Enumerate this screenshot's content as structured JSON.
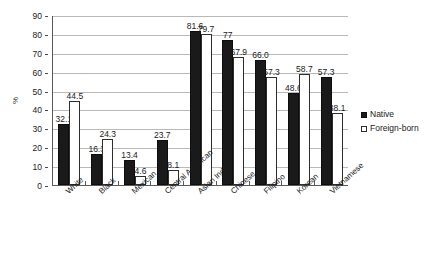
{
  "chart_data": {
    "type": "bar",
    "title": "",
    "subtitle": "",
    "xlabel": "",
    "ylabel": "%",
    "ylim": [
      0,
      90
    ],
    "ytick_step": 10,
    "yticks": [
      "0",
      "10",
      "20",
      "30",
      "40",
      "50",
      "60",
      "70",
      "80",
      "90"
    ],
    "grid": true,
    "grid_axis": "y",
    "legend_position": "right",
    "categories": [
      "White",
      "Black",
      "Mexican",
      "Central American",
      "Asian Indian",
      "Chinese",
      "Filipino",
      "Korean",
      "Vietnamese"
    ],
    "series": [
      {
        "name": "Native",
        "color": "#1a1a1a",
        "values": [
          32.1,
          16.3,
          13.4,
          23.7,
          81.6,
          77,
          66.0,
          48.6,
          57.3
        ],
        "labels": [
          "32.1",
          "16.3",
          "13.4",
          "23.7",
          "81.6",
          "77",
          "66.0",
          "48.6",
          "57.3"
        ]
      },
      {
        "name": "Foreign-born",
        "color": "#ffffff",
        "values": [
          44.5,
          24.3,
          4.6,
          8.1,
          79.7,
          67.9,
          57.3,
          58.7,
          38.1
        ],
        "labels": [
          "44.5",
          "24.3",
          "4.6",
          "8.1",
          "79.7",
          "67.9",
          "57.3",
          "58.7",
          "38.1"
        ]
      }
    ]
  },
  "legend": {
    "items": [
      {
        "label": "Native",
        "marker": "filled-square-icon"
      },
      {
        "label": "Foreign-born",
        "marker": "open-square-icon"
      }
    ]
  },
  "colors": {
    "native_fill": "#1a1a1a",
    "foreign_fill": "#ffffff",
    "bar_outline": "#2e2e2e",
    "gridline": "#b9b9b9",
    "axis": "#5a5a5a",
    "text": "#1a1a1a",
    "background": "#ffffff"
  }
}
